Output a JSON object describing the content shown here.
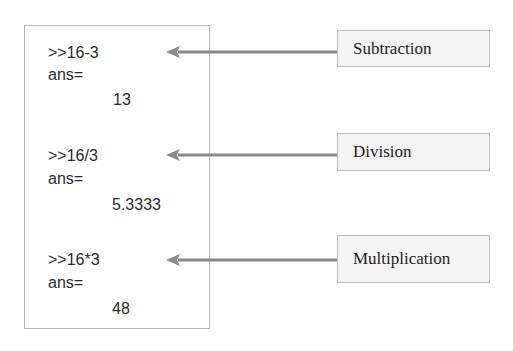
{
  "console": {
    "blocks": [
      {
        "command": ">>16-3",
        "ans_label": "ans=",
        "result": "13"
      },
      {
        "command": ">>16/3",
        "ans_label": "ans=",
        "result": "5.3333"
      },
      {
        "command": ">>16*3",
        "ans_label": "ans=",
        "result": "48"
      }
    ]
  },
  "labels": [
    "Subtraction",
    "Division",
    "Multiplication"
  ],
  "colors": {
    "arrow": "#8a8a8a",
    "label_bg": "#f4f4f4",
    "border": "#b5b5b5",
    "text": "#2a2a2a"
  }
}
